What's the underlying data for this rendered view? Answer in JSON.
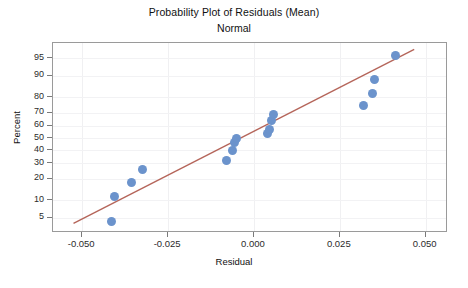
{
  "chart_data": {
    "type": "scatter",
    "title": "Probability Plot of Residuals (Mean)",
    "subtitle": "Normal",
    "xlabel": "Residual",
    "ylabel": "Percent",
    "grid": true,
    "legend": null,
    "xlim": [
      -0.0585,
      0.0565
    ],
    "ylim_percent": [
      2.5,
      97.5
    ],
    "xticks": [
      -0.05,
      -0.025,
      0.0,
      0.025,
      0.05
    ],
    "xtick_labels": [
      "-0.050",
      "-0.025",
      "0.000",
      "0.025",
      "0.050"
    ],
    "yticks_percent": [
      5,
      10,
      20,
      30,
      40,
      50,
      60,
      70,
      80,
      90,
      95
    ],
    "ytick_labels": [
      "5",
      "10",
      "20",
      "30",
      "40",
      "50",
      "60",
      "70",
      "80",
      "90",
      "95"
    ],
    "marker_color": "#6b93cc",
    "line_color": "#b5655a",
    "series": [
      {
        "name": "Residuals",
        "points": [
          {
            "x": -0.0415,
            "percent": 4.2
          },
          {
            "x": -0.0405,
            "percent": 11.5
          },
          {
            "x": -0.0357,
            "percent": 18.0
          },
          {
            "x": -0.0325,
            "percent": 25.5
          },
          {
            "x": -0.008,
            "percent": 32.5
          },
          {
            "x": -0.0062,
            "percent": 39.5
          },
          {
            "x": -0.0058,
            "percent": 46.0
          },
          {
            "x": -0.005,
            "percent": 50.0
          },
          {
            "x": 0.004,
            "percent": 53.5
          },
          {
            "x": 0.0044,
            "percent": 57.0
          },
          {
            "x": 0.0052,
            "percent": 64.0
          },
          {
            "x": 0.0056,
            "percent": 68.5
          },
          {
            "x": 0.032,
            "percent": 75.0
          },
          {
            "x": 0.0345,
            "percent": 82.0
          },
          {
            "x": 0.0352,
            "percent": 88.5
          },
          {
            "x": 0.0412,
            "percent": 95.5
          }
        ]
      }
    ],
    "reference_line": {
      "name": "normal-fit-line",
      "x_start": -0.0525,
      "percent_start": 3.6,
      "x_end": 0.0472,
      "percent_end": 96.6
    }
  }
}
